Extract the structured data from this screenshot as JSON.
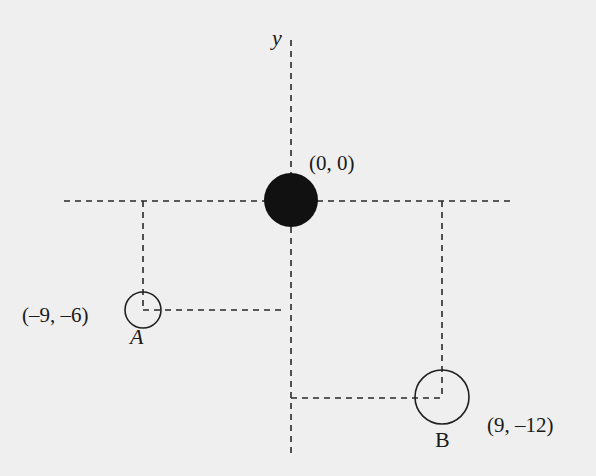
{
  "diagram": {
    "axis_label_y": "y",
    "origin_label": "(0, 0)",
    "point_a": {
      "name": "A",
      "coordinate_label": "(–9, –6)"
    },
    "point_b": {
      "name": "B",
      "coordinate_label": "(9, –12)"
    },
    "colors": {
      "background": "#efefef",
      "ink": "#1a1a1a",
      "origin_fill": "#111111"
    }
  }
}
